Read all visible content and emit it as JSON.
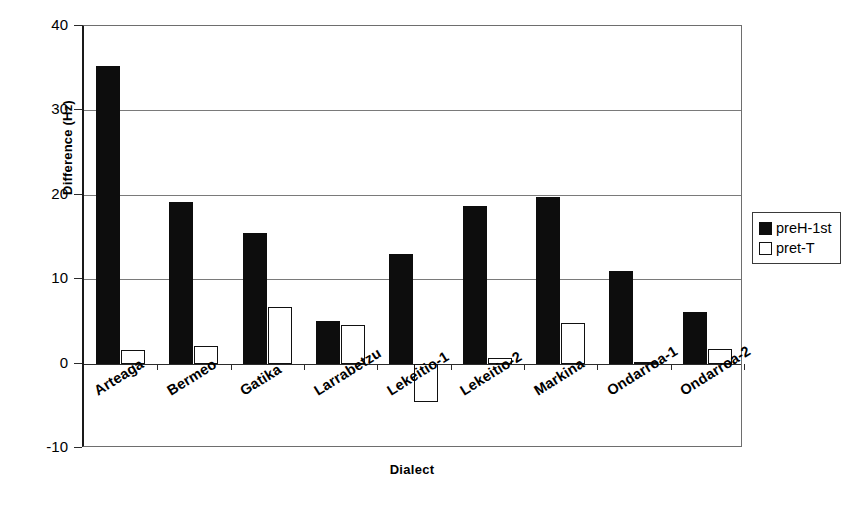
{
  "chart_data": {
    "type": "bar",
    "title": "",
    "xlabel": "Dialect",
    "ylabel": "Difference (Hz)",
    "ylim": [
      -10,
      40
    ],
    "ytick_labels": [
      "40",
      "30",
      "20",
      "10",
      "0",
      "-10"
    ],
    "ytick_values": [
      40,
      30,
      20,
      10,
      0,
      -10
    ],
    "grid": true,
    "legend_position": "right",
    "categories": [
      "Arteaga",
      "Bermeo",
      "Gatika",
      "Larrabetzu",
      "Lekeitio-1",
      "Lekeitio-2",
      "Markina",
      "Ondarroa-1",
      "Ondarroa-2"
    ],
    "series": [
      {
        "name": "preH-1st",
        "color": "#0d0d0d",
        "values": [
          35.3,
          19.2,
          15.5,
          5.1,
          13.0,
          18.7,
          19.7,
          11.0,
          6.1
        ]
      },
      {
        "name": "pret-T",
        "color": "#ffffff",
        "values": [
          1.6,
          2.1,
          6.7,
          4.6,
          -4.6,
          0.7,
          4.8,
          0.2,
          1.7
        ]
      }
    ]
  },
  "legend": {
    "items": [
      {
        "label": "preH-1st",
        "style": "dark"
      },
      {
        "label": "pret-T",
        "style": "light"
      }
    ]
  }
}
